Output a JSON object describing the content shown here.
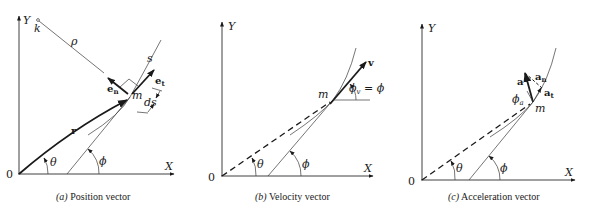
{
  "panels": [
    {
      "id": "a",
      "caption_letter": "(a)",
      "caption_text": " Position vector",
      "labels": {
        "y_axis": "Y",
        "x_axis": "X",
        "origin": "0",
        "center_of_curvature": "k",
        "radius_of_curvature": "ρ",
        "path": "s",
        "position_vector": "r",
        "unit_tangent": "e",
        "unit_tangent_sub": "t",
        "unit_normal": "e",
        "unit_normal_sub": "n",
        "particle": "m",
        "arc_element": "ds",
        "angle_theta": "θ",
        "angle_phi": "ϕ"
      }
    },
    {
      "id": "b",
      "caption_letter": "(b)",
      "caption_text": " Velocity vector",
      "labels": {
        "y_axis": "Y",
        "x_axis": "X",
        "origin": "0",
        "velocity": "v",
        "particle": "m",
        "phi_v": "ϕ",
        "phi_v_sub": "v",
        "equals_phi": " = ϕ",
        "angle_theta": "θ",
        "angle_phi": "ϕ"
      }
    },
    {
      "id": "c",
      "caption_letter": "(c)",
      "caption_text": " Acceleration vector",
      "labels": {
        "y_axis": "Y",
        "x_axis": "X",
        "origin": "0",
        "acceleration": "a",
        "normal_accel": "a",
        "normal_accel_sub": "n",
        "tangential_accel": "a",
        "tangential_accel_sub": "t",
        "phi_a": "ϕ",
        "phi_a_sub": "a",
        "particle": "m",
        "angle_theta": "θ",
        "angle_phi": "ϕ"
      }
    }
  ]
}
